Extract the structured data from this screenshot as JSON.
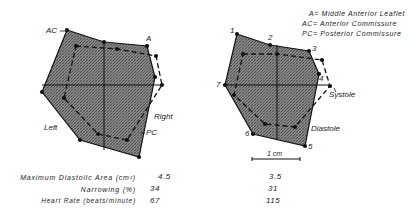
{
  "legend": [
    "A= Middle Anterior Leaflet",
    "AC= Anterior Commissure",
    "PC= Posterior Commissure"
  ],
  "left_panel": {
    "labels": {
      "ac": "AC",
      "a": "A",
      "right": "Right",
      "left": "Left",
      "pc": "PC"
    },
    "diastole_polygon": [
      [
        67,
        30
      ],
      [
        104,
        42
      ],
      [
        147,
        46
      ],
      [
        155,
        77
      ],
      [
        139,
        157
      ],
      [
        80,
        140
      ],
      [
        42,
        92
      ]
    ],
    "systole_polygon": [
      [
        76,
        46
      ],
      [
        117,
        49
      ],
      [
        156,
        56
      ],
      [
        162,
        85
      ],
      [
        127,
        140
      ],
      [
        98,
        134
      ],
      [
        64,
        98
      ]
    ],
    "axes": {
      "h": [
        [
          42,
          85
        ],
        [
          162,
          85
        ]
      ],
      "v": [
        [
          104,
          42
        ],
        [
          104,
          150
        ]
      ]
    }
  },
  "right_panel": {
    "labels": {
      "p1": "1",
      "p2": "2",
      "p3": "3",
      "p4": "4",
      "p5": "5",
      "p6": "6",
      "p7": "7",
      "systole": "Systole",
      "diastole": "Diastole"
    },
    "diastole_polygon": [
      [
        237,
        34
      ],
      [
        270,
        45
      ],
      [
        309,
        51
      ],
      [
        319,
        74
      ],
      [
        305,
        146
      ],
      [
        253,
        134
      ],
      [
        225,
        85
      ]
    ],
    "systole_polygon": [
      [
        243,
        54
      ],
      [
        277,
        54
      ],
      [
        322,
        60
      ],
      [
        330,
        86
      ],
      [
        295,
        127
      ],
      [
        265,
        124
      ],
      [
        234,
        95
      ]
    ],
    "axes": {
      "h": [
        [
          225,
          85
        ],
        [
          330,
          85
        ]
      ],
      "v": [
        [
          277,
          45
        ],
        [
          277,
          140
        ]
      ]
    },
    "scale_bar": {
      "label": "1 cm",
      "x1": 252,
      "x2": 300,
      "y": 159
    }
  },
  "stats": [
    {
      "label": "Maximum Diastolic Area (cm²)",
      "left": "4.5",
      "right": "3.5"
    },
    {
      "label": "Narrowing (%)",
      "left": "34",
      "right": "31"
    },
    {
      "label": "Heart Rate (beats/minute)",
      "left": "67",
      "right": "115"
    }
  ]
}
